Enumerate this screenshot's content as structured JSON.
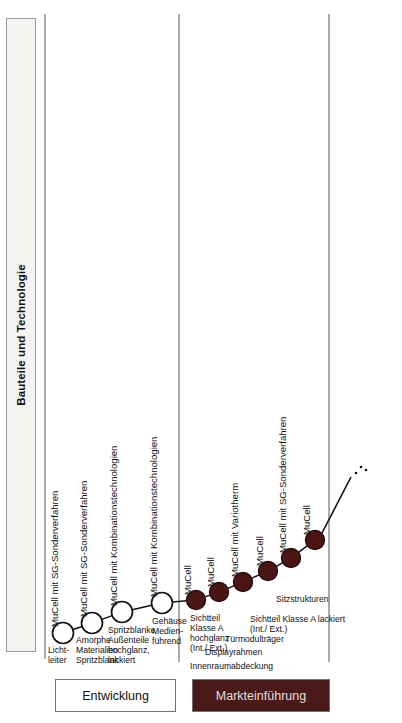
{
  "diagram": {
    "category_axis_label": "Bauteile und Technologie",
    "colors": {
      "node_open_fill": "#ffffff",
      "node_open_stroke": "#111111",
      "node_filled_fill": "#4a1512",
      "node_filled_stroke": "#2a0b09",
      "connector": "#111111",
      "phase_market_bg": "#4a1a18",
      "panel_bg": "#f4f3ef",
      "divider": "#8d8d8d"
    },
    "nodes": [
      {
        "id": "n1",
        "title": "MuCell mit SG-Sonderverfahren",
        "caption": "Licht-\nleiter",
        "state": "open",
        "x": 63,
        "y": 633,
        "r": 10.5
      },
      {
        "id": "n2",
        "title": "MuCell mit SG-Sonderverfahren",
        "caption": "Amorphe\nMaterialien\nSpritzblank",
        "state": "open",
        "x": 92,
        "y": 623,
        "r": 10.5
      },
      {
        "id": "n3",
        "title": "MuCell mit Kombinationstechnologien",
        "caption": "Spritzblanke\nAußenteile\nhochglanz,\nlackiert",
        "state": "open",
        "x": 122,
        "y": 612,
        "r": 10.5
      },
      {
        "id": "n4",
        "title": "MuCell mit Kombinationstechnologien",
        "caption": "Gehäuse\nMedien-\nführend",
        "state": "open",
        "x": 162,
        "y": 603,
        "r": 10.5
      },
      {
        "id": "n5",
        "title": "MuCell",
        "caption": "Sichtteil\nKlasse A\nhochglanz\n(Int./ Ext.)",
        "state": "filled",
        "x": 196,
        "y": 600,
        "r": 9.5
      },
      {
        "id": "n6",
        "title": "MuCell",
        "caption": "Innenraumabdeckung",
        "state": "filled",
        "x": 219,
        "y": 592,
        "r": 9.5
      },
      {
        "id": "n7",
        "title": "MuCell mit Variotherm",
        "caption": "Displayrahmen",
        "state": "filled",
        "x": 243,
        "y": 582,
        "r": 9.5
      },
      {
        "id": "n8",
        "title": "MuCell",
        "caption": "Türmodulträger",
        "state": "filled",
        "x": 268,
        "y": 571,
        "r": 9.5
      },
      {
        "id": "n9",
        "title": "MuCell mit SG-Sonderverfahren",
        "caption": "Sichtteil Klasse A lackiert\n(Int./ Ext.)",
        "state": "filled",
        "x": 291,
        "y": 558,
        "r": 9.5
      },
      {
        "id": "n10",
        "title": "MuCell",
        "caption": "Sitzstrukturen",
        "state": "filled",
        "x": 315,
        "y": 540,
        "r": 9.5
      }
    ],
    "trend_continuation": "…",
    "phases": [
      {
        "id": "development",
        "label": "Entwicklung"
      },
      {
        "id": "market_launch",
        "label": "Markteinführung"
      }
    ]
  },
  "chart_data": {
    "type": "scatter",
    "title": "Bauteile und Technologie",
    "xlabel": "",
    "ylabel": "Bauteile und Technologie",
    "grid": false,
    "legend": "none",
    "categories": [
      "Lichtleiter",
      "Amorphe Materialien Spritzblank",
      "Spritzblanke Außenteile hochglanz, lackiert",
      "Gehäuse Medienführend",
      "Sichtteil Klasse A hochglanz (Int./ Ext.)",
      "Innenraumabdeckung",
      "Displayrahmen",
      "Türmodulträger",
      "Sichtteil Klasse A lackiert (Int./ Ext.)",
      "Sitzstrukturen"
    ],
    "series": [
      {
        "name": "Technologiereifegrad",
        "values": [
          1,
          2,
          3,
          4,
          5,
          6,
          7,
          8,
          9,
          10
        ]
      }
    ],
    "annotations": [
      "MuCell mit SG-Sonderverfahren",
      "MuCell mit SG-Sonderverfahren",
      "MuCell mit Kombinationstechnologien",
      "MuCell mit Kombinationstechnologien",
      "MuCell",
      "MuCell",
      "MuCell mit Variotherm",
      "MuCell",
      "MuCell mit SG-Sonderverfahren",
      "MuCell"
    ],
    "phase_bands": [
      "Entwicklung",
      "Markteinführung"
    ]
  }
}
